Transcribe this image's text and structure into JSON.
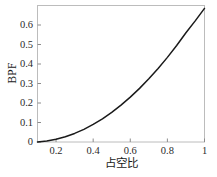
{
  "chart_data": {
    "type": "line",
    "title": "",
    "xlabel": "占空比",
    "ylabel": "BPF",
    "xlim": [
      0.1,
      1.0
    ],
    "ylim": [
      0.0,
      0.7
    ],
    "grid": false,
    "legend": null,
    "xticks": [
      "0.2",
      "0.4",
      "0.6",
      "0.8",
      "1"
    ],
    "xtick_values": [
      0.2,
      0.4,
      0.6,
      0.8,
      1.0
    ],
    "yticks": [
      "0",
      "0.1",
      "0.2",
      "0.3",
      "0.4",
      "0.5",
      "0.6"
    ],
    "ytick_values": [
      0,
      0.1,
      0.2,
      0.3,
      0.4,
      0.5,
      0.6
    ],
    "series": [
      {
        "name": "BPF",
        "color": "#1a1a1a",
        "x": [
          0.1,
          0.15,
          0.2,
          0.25,
          0.3,
          0.35,
          0.4,
          0.45,
          0.5,
          0.55,
          0.6,
          0.65,
          0.7,
          0.75,
          0.8,
          0.85,
          0.9,
          0.95,
          1.0
        ],
        "values": [
          0.0,
          0.005,
          0.014,
          0.027,
          0.044,
          0.065,
          0.09,
          0.119,
          0.152,
          0.189,
          0.23,
          0.275,
          0.324,
          0.377,
          0.434,
          0.495,
          0.56,
          0.621,
          0.685
        ]
      }
    ]
  },
  "axes": {
    "frame_color": "#b9b9b9",
    "tick_color": "#8c8c8c"
  }
}
